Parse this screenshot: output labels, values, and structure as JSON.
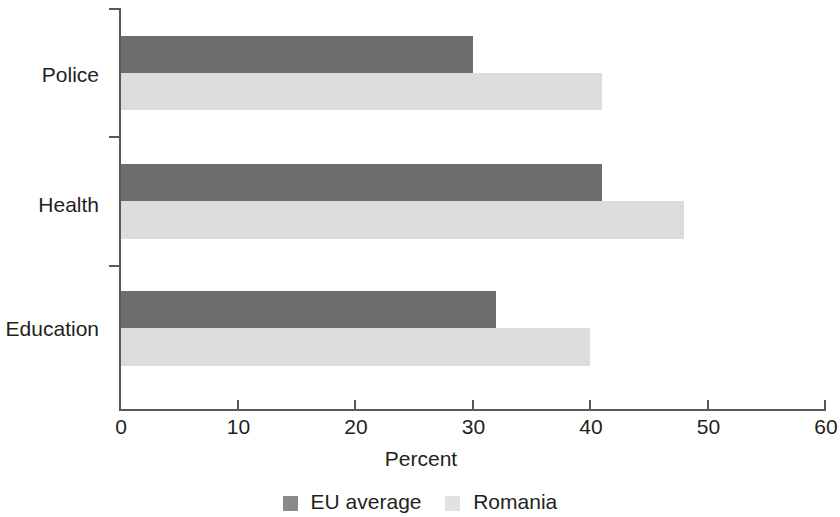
{
  "chart_data": {
    "type": "bar",
    "orientation": "horizontal",
    "title": "",
    "xlabel": "Percent",
    "ylabel": "",
    "categories": [
      "Police",
      "Health",
      "Education"
    ],
    "series": [
      {
        "name": "EU average",
        "color": "#6e6e6e",
        "values": [
          30,
          41,
          32
        ]
      },
      {
        "name": "Romania",
        "color": "#dcdcdc",
        "values": [
          41,
          48,
          40
        ]
      }
    ],
    "xlim": [
      0,
      60
    ],
    "xticks": [
      0,
      10,
      20,
      30,
      40,
      50,
      60
    ],
    "xtick_labels": [
      "0",
      "10",
      "20",
      "30",
      "40",
      "50",
      "60"
    ],
    "grid": false,
    "legend_position": "bottom",
    "legend_entries": [
      "EU average",
      "Romania"
    ]
  },
  "axis": {
    "x_title": "Percent",
    "tick_labels": [
      "0",
      "10",
      "20",
      "30",
      "40",
      "50",
      "60"
    ]
  },
  "categories": {
    "police": "Police",
    "health": "Health",
    "education": "Education"
  },
  "legend": {
    "eu_average": "EU average",
    "romania": "Romania"
  }
}
